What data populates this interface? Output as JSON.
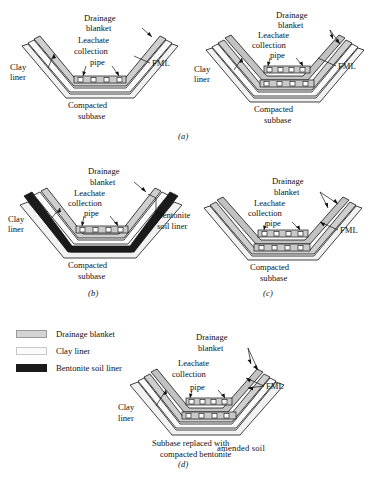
{
  "figure": {
    "bottom_caption": "",
    "labels": {
      "drainage_blanket": "Drainage\nblanket",
      "drainage_line1": "Drainage",
      "drainage_line2": "blanket",
      "leachate_line1": "Leachate",
      "leachate_line2": "collection",
      "leachate_line3": "pipe",
      "clay_line1": "Clay",
      "clay_line2": "liner",
      "fml": "FML",
      "compacted_line1": "Compacted",
      "compacted_line2": "subbase",
      "bentonite_line1": "Bentonite",
      "bentonite_line2": "soil liner",
      "subbase_repl_line1": "Subbase replaced with",
      "subbase_repl_line2": "compacted bentonite",
      "subbase_repl_line3": "amended soil"
    }
  },
  "colors": {
    "drainage_blanket": "#cfcfcf",
    "drainage_blanket_dark": "#b8b8b8",
    "clay_liner": "#fbfbfb",
    "bentonite_soil_liner": "#1b1b1b",
    "subbase": "#f2f2f2",
    "outline": "#111111",
    "pipe_fill": "#ffffff"
  },
  "panels": [
    {
      "id": "a-left",
      "caption": "",
      "liner_layers": [
        "clay liner",
        "drainage blanket"
      ],
      "pipe_rows": 1,
      "pipes_per_row": 4,
      "base_label_line1": "Compacted",
      "base_label_line2": "subbase",
      "callouts": [
        "Drainage blanket",
        "Leachate collection pipe",
        "Clay liner",
        "FML",
        "Compacted subbase"
      ]
    },
    {
      "id": "a-right",
      "caption": "(a)",
      "liner_layers": [
        "clay liner",
        "drainage blanket",
        "drainage blanket"
      ],
      "pipe_rows": 2,
      "pipes_per_row": 4,
      "base_label_line1": "Compacted",
      "base_label_line2": "subbase",
      "callouts": [
        "Drainage blanket",
        "Leachate collection pipe",
        "Clay liner",
        "FML",
        "Compacted subbase"
      ]
    },
    {
      "id": "b",
      "caption": "(b)",
      "liner_layers": [
        "bentonite soil liner",
        "clay liner",
        "drainage blanket"
      ],
      "pipe_rows": 1,
      "pipes_per_row": 4,
      "base_label_line1": "Compacted",
      "base_label_line2": "subbase",
      "callouts": [
        "Drainage blanket",
        "Leachate collection pipe",
        "Clay liner",
        "Bentonite soil liner",
        "Compacted subbase"
      ]
    },
    {
      "id": "c",
      "caption": "(c)",
      "liner_layers": [
        "drainage blanket",
        "drainage blanket"
      ],
      "pipe_rows": 2,
      "pipes_per_row": 4,
      "base_label_line1": "Compacted",
      "base_label_line2": "subbase",
      "callouts": [
        "Drainage blanket",
        "Leachate collection pipe",
        "FML",
        "Compacted subbase"
      ]
    },
    {
      "id": "d",
      "caption": "(d)",
      "liner_layers": [
        "clay liner",
        "drainage blanket",
        "drainage blanket"
      ],
      "pipe_rows": 2,
      "pipes_per_row": 4,
      "base_label_line1": "Subbase replaced with",
      "base_label_line2": "compacted bentonite",
      "base_label_line3": "amended soil",
      "callouts": [
        "Drainage blanket",
        "Leachate collection pipe",
        "Clay liner",
        "FML",
        "Subbase replaced with compacted bentonite amended soil"
      ]
    }
  ],
  "legend": {
    "items": [
      {
        "label": "Drainage blanket",
        "swatch": "drainage"
      },
      {
        "label": "Clay liner",
        "swatch": "clay"
      },
      {
        "label": "Bentonite soil liner",
        "swatch": "bentonite"
      }
    ]
  }
}
